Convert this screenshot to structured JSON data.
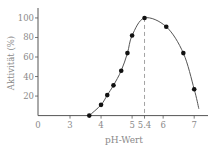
{
  "chart_data": {
    "type": "line",
    "title": "",
    "xlabel": "pH-Wert",
    "ylabel": "Aktivität (%)",
    "x_ticks": [
      "0",
      "3",
      "4",
      "5",
      "5.4",
      "6",
      "7"
    ],
    "x_tick_values": [
      0,
      3,
      4,
      5,
      5.4,
      6,
      7
    ],
    "y_ticks": [
      "20",
      "40",
      "60",
      "80",
      "100"
    ],
    "y_tick_values": [
      20,
      40,
      60,
      80,
      100
    ],
    "xlim": [
      0,
      7.5
    ],
    "ylim": [
      0,
      110
    ],
    "x_axis_break": "between 0 and 3",
    "grid": false,
    "legend": null,
    "series": [
      {
        "name": "Aktivität",
        "x": [
          3.62,
          4.0,
          4.2,
          4.4,
          4.65,
          4.85,
          5.0,
          5.4,
          6.1,
          6.65,
          7.0
        ],
        "values": [
          0,
          11,
          21,
          31,
          46,
          64,
          82,
          100,
          91,
          64,
          27
        ]
      }
    ],
    "curve_end": {
      "x": 7.15,
      "y": 7
    },
    "annotations": [
      {
        "type": "vertical-dashed-line",
        "x": 5.4,
        "label": "5.4",
        "description": "pH optimum"
      }
    ]
  },
  "colors": {
    "axis": "#555555",
    "curve": "#555555",
    "points": "#111111",
    "dashed": "#999999",
    "text": "#8a8a8a"
  }
}
